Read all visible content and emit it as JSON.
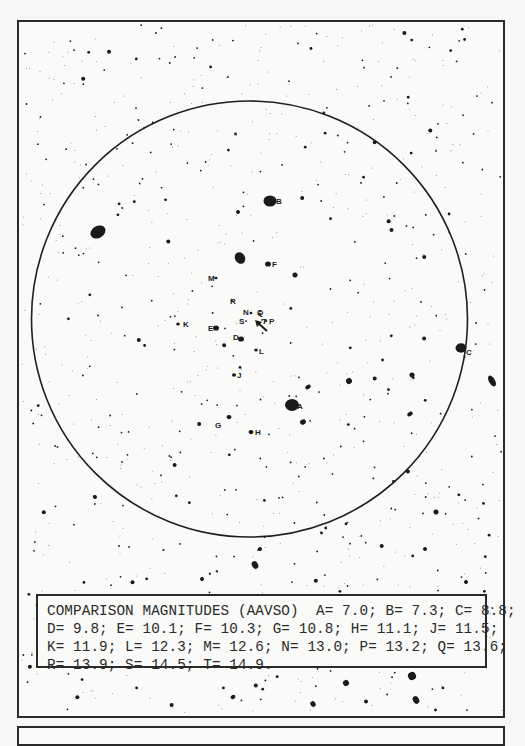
{
  "chart": {
    "title_box": {
      "heading": "COMPARISON MAGNITUDES (AAVSO)",
      "lines": [
        "COMPARISON MAGNITUDES (AAVSO)  A= 7.0; B= 7.3; C= 8.8;",
        "D= 9.8; E= 10.1; F= 10.3; G= 10.8; H= 11.1; J= 11.5;",
        "K= 11.9; L= 12.3; M= 12.6; N= 13.0; P= 13.2; Q= 13.6;",
        "R= 13.9; S= 14.5; T= 14.9."
      ]
    },
    "field_circle": {
      "cx": 249.5,
      "cy": 319,
      "r": 218
    },
    "variable_marker": {
      "name": "arrow-pointer",
      "x": 258,
      "y": 323
    },
    "comparison_stars": [
      {
        "label": "A",
        "mag": 7.0,
        "x": 292,
        "y": 405,
        "size": 7,
        "lx": 297,
        "ly": 409
      },
      {
        "label": "B",
        "mag": 7.3,
        "x": 270,
        "y": 201,
        "size": 6.5,
        "lx": 276,
        "ly": 204
      },
      {
        "label": "C",
        "mag": 8.8,
        "x": 461,
        "y": 348,
        "size": 5.5,
        "lx": 466,
        "ly": 355
      },
      {
        "label": "D",
        "mag": 9.8,
        "x": 241,
        "y": 339,
        "size": 3,
        "lx": 233,
        "ly": 340
      },
      {
        "label": "E",
        "mag": 10.1,
        "x": 216,
        "y": 328,
        "size": 3,
        "lx": 208,
        "ly": 331
      },
      {
        "label": "F",
        "mag": 10.3,
        "x": 268,
        "y": 264,
        "size": 3,
        "lx": 272,
        "ly": 267
      },
      {
        "label": "G",
        "mag": 10.8,
        "x": 229,
        "y": 417,
        "size": 2.5,
        "lx": 215,
        "ly": 428
      },
      {
        "label": "H",
        "mag": 11.1,
        "x": 251,
        "y": 432,
        "size": 2.5,
        "lx": 255,
        "ly": 435
      },
      {
        "label": "J",
        "mag": 11.5,
        "x": 234,
        "y": 375,
        "size": 2,
        "lx": 237,
        "ly": 378
      },
      {
        "label": "K",
        "mag": 11.9,
        "x": 178,
        "y": 324,
        "size": 1.8,
        "lx": 183,
        "ly": 327
      },
      {
        "label": "L",
        "mag": 12.3,
        "x": 256,
        "y": 350,
        "size": 1.8,
        "lx": 259,
        "ly": 354
      },
      {
        "label": "M",
        "mag": 12.6,
        "x": 216,
        "y": 278,
        "size": 1.6,
        "lx": 208,
        "ly": 281
      },
      {
        "label": "N",
        "mag": 13.0,
        "x": 251,
        "y": 313,
        "size": 1.4,
        "lx": 243,
        "ly": 315
      },
      {
        "label": "P",
        "mag": 13.2,
        "x": 266,
        "y": 321,
        "size": 1.3,
        "lx": 269,
        "ly": 324
      },
      {
        "label": "Q",
        "mag": 13.6,
        "x": 260,
        "y": 311,
        "size": 1.2,
        "lx": 257,
        "ly": 315
      },
      {
        "label": "R",
        "mag": 13.9,
        "x": 232,
        "y": 301,
        "size": 1.1,
        "lx": 230,
        "ly": 304
      },
      {
        "label": "S",
        "mag": 14.5,
        "x": 246,
        "y": 321,
        "size": 1,
        "lx": 239,
        "ly": 324
      },
      {
        "label": "T",
        "mag": 14.9,
        "x": 262,
        "y": 320,
        "size": 0.9,
        "lx": 262,
        "ly": 324
      }
    ],
    "bright_unlabeled_stars": [
      {
        "x": 98,
        "y": 232,
        "rx": 8,
        "ry": 6
      },
      {
        "x": 240,
        "y": 258,
        "rx": 5,
        "ry": 6
      },
      {
        "x": 492,
        "y": 381,
        "rx": 3,
        "ry": 6
      },
      {
        "x": 255,
        "y": 565,
        "rx": 3,
        "ry": 4
      },
      {
        "x": 412,
        "y": 676,
        "rx": 4,
        "ry": 4
      },
      {
        "x": 346,
        "y": 683,
        "rx": 3,
        "ry": 3
      },
      {
        "x": 416,
        "y": 700,
        "rx": 3,
        "ry": 4
      },
      {
        "x": 308,
        "y": 387,
        "rx": 3,
        "ry": 2
      },
      {
        "x": 349,
        "y": 381,
        "rx": 3,
        "ry": 3
      },
      {
        "x": 303,
        "y": 422,
        "rx": 3,
        "ry": 2.5
      },
      {
        "x": 238,
        "y": 212,
        "rx": 2,
        "ry": 2
      },
      {
        "x": 295,
        "y": 275,
        "rx": 2.5,
        "ry": 2.5
      },
      {
        "x": 412,
        "y": 375,
        "rx": 2.5,
        "ry": 2.5
      },
      {
        "x": 410,
        "y": 414,
        "rx": 3,
        "ry": 2
      },
      {
        "x": 95,
        "y": 497,
        "rx": 2,
        "ry": 2
      },
      {
        "x": 436,
        "y": 512,
        "rx": 2.5,
        "ry": 2.5
      },
      {
        "x": 466,
        "y": 582,
        "rx": 2,
        "ry": 2
      },
      {
        "x": 425,
        "y": 549,
        "rx": 2,
        "ry": 2
      },
      {
        "x": 260,
        "y": 549,
        "rx": 2,
        "ry": 2
      },
      {
        "x": 202,
        "y": 579,
        "rx": 2,
        "ry": 2
      },
      {
        "x": 233,
        "y": 697,
        "rx": 2.5,
        "ry": 2
      },
      {
        "x": 313,
        "y": 704,
        "rx": 2.5,
        "ry": 3
      }
    ],
    "colors": {
      "ink": "#1a1a1a",
      "paper": "#fafaf8",
      "border": "#2a2a2a"
    }
  }
}
